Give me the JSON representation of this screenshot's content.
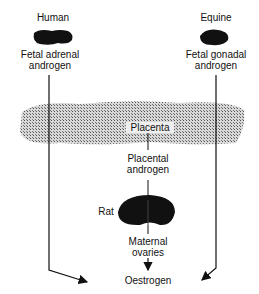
{
  "diagram": {
    "sources": {
      "left": {
        "species": "Human",
        "product_line1": "Fetal adrenal",
        "product_line2": "androgen"
      },
      "right": {
        "species": "Equine",
        "product_line1": "Fetal gonadal",
        "product_line2": "androgen"
      }
    },
    "placenta": {
      "label": "Placenta"
    },
    "placental_androgen": {
      "line1": "Placental",
      "line2": "androgen"
    },
    "rat": {
      "label": "Rat"
    },
    "maternal_ovaries": {
      "line1": "Maternal",
      "line2": "ovaries"
    },
    "target": {
      "label": "Oestrogen"
    },
    "colors": {
      "ink": "#111111",
      "placenta_fill": "#9a9a9a"
    }
  }
}
